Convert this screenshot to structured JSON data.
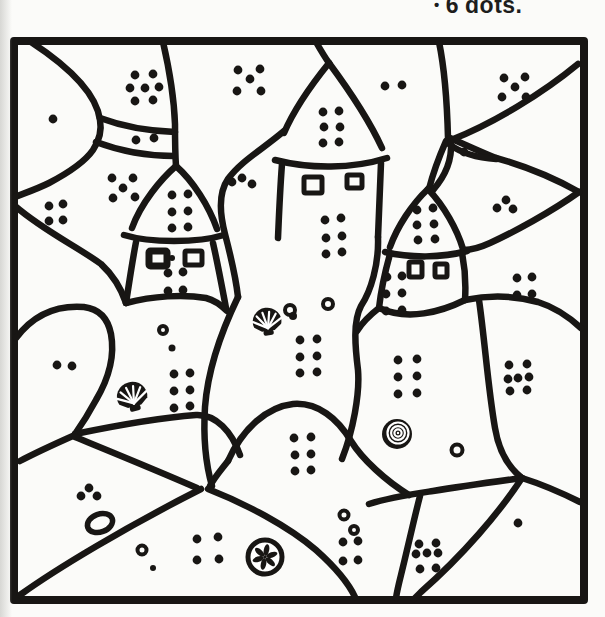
{
  "caption": {
    "bullet": "•",
    "count": "6",
    "label": "dots."
  },
  "colors": {
    "ink": "#181614",
    "paper": "#ffffff",
    "page_bg": "#fbfbf9"
  },
  "drawing": {
    "dot_radius": 4.4,
    "clusters": [
      {
        "id": "top-left-arch",
        "count": 7,
        "dots": [
          [
            135,
            75
          ],
          [
            153,
            74
          ],
          [
            130,
            88
          ],
          [
            145,
            88
          ],
          [
            159,
            87
          ],
          [
            135,
            101
          ],
          [
            153,
            100
          ]
        ]
      },
      {
        "id": "top-middle",
        "count": 5,
        "dots": [
          [
            238,
            70
          ],
          [
            260,
            69
          ],
          [
            250,
            79
          ],
          [
            237,
            91
          ],
          [
            261,
            91
          ]
        ]
      },
      {
        "id": "right-of-center-roof",
        "count": 2,
        "dots": [
          [
            385,
            86
          ],
          [
            402,
            85
          ]
        ]
      },
      {
        "id": "top-right",
        "count": 5,
        "dots": [
          [
            504,
            78
          ],
          [
            525,
            77
          ],
          [
            515,
            87
          ],
          [
            502,
            97
          ],
          [
            526,
            97
          ]
        ]
      },
      {
        "id": "corner-blob",
        "count": 1,
        "dots": [
          [
            53,
            119
          ]
        ]
      },
      {
        "id": "band-path",
        "count": 2,
        "dots": [
          [
            136,
            140
          ],
          [
            154,
            138
          ]
        ]
      },
      {
        "id": "center-roof",
        "count": 6,
        "dots": [
          [
            323,
            112
          ],
          [
            339,
            111
          ],
          [
            324,
            127
          ],
          [
            340,
            127
          ],
          [
            323,
            143
          ],
          [
            339,
            142
          ]
        ]
      },
      {
        "id": "wedge-dot",
        "count": 1,
        "dots": [
          [
            464,
            152
          ]
        ]
      },
      {
        "id": "left-of-left-tower",
        "count": 5,
        "dots": [
          [
            112,
            178
          ],
          [
            133,
            178
          ],
          [
            123,
            188
          ],
          [
            113,
            198
          ],
          [
            135,
            197
          ]
        ]
      },
      {
        "id": "left-band",
        "count": 3,
        "dots": [
          [
            232,
            182
          ],
          [
            242,
            178
          ],
          [
            252,
            184
          ]
        ]
      },
      {
        "id": "left-roof",
        "count": 6,
        "dots": [
          [
            172,
            195
          ],
          [
            188,
            194
          ],
          [
            172,
            212
          ],
          [
            188,
            211
          ],
          [
            172,
            228
          ],
          [
            188,
            227
          ]
        ]
      },
      {
        "id": "right-wedge",
        "count": 3,
        "dots": [
          [
            497,
            208
          ],
          [
            506,
            200
          ],
          [
            513,
            209
          ]
        ]
      },
      {
        "id": "left-border-region",
        "count": 4,
        "dots": [
          [
            49,
            206
          ],
          [
            63,
            204
          ],
          [
            49,
            221
          ],
          [
            63,
            220
          ]
        ]
      },
      {
        "id": "right-roof",
        "count": 6,
        "dots": [
          [
            417,
            210
          ],
          [
            433,
            208
          ],
          [
            417,
            225
          ],
          [
            434,
            224
          ],
          [
            418,
            240
          ],
          [
            435,
            239
          ]
        ]
      },
      {
        "id": "center-body",
        "count": 6,
        "dots": [
          [
            325,
            220
          ],
          [
            341,
            218
          ],
          [
            326,
            238
          ],
          [
            342,
            236
          ],
          [
            326,
            254
          ],
          [
            342,
            252
          ]
        ]
      },
      {
        "id": "left-body",
        "count": 4,
        "dots": [
          [
            168,
            273
          ],
          [
            183,
            272
          ],
          [
            168,
            291
          ],
          [
            183,
            290
          ]
        ]
      },
      {
        "id": "right-body",
        "count": 6,
        "dots": [
          [
            387,
            277
          ],
          [
            402,
            276
          ],
          [
            386,
            294
          ],
          [
            402,
            293
          ],
          [
            386,
            311
          ],
          [
            402,
            310
          ]
        ]
      },
      {
        "id": "right-upper-band",
        "count": 4,
        "dots": [
          [
            517,
            278
          ],
          [
            532,
            277
          ],
          [
            517,
            295
          ],
          [
            532,
            294
          ]
        ]
      },
      {
        "id": "left-mound",
        "count": 2,
        "dots": [
          [
            57,
            365
          ],
          [
            72,
            366
          ]
        ]
      },
      {
        "id": "left-middle",
        "count": 6,
        "dots": [
          [
            174,
            374
          ],
          [
            190,
            373
          ],
          [
            174,
            391
          ],
          [
            190,
            390
          ],
          [
            174,
            408
          ],
          [
            190,
            406
          ]
        ]
      },
      {
        "id": "center-mound",
        "count": 6,
        "dots": [
          [
            300,
            340
          ],
          [
            317,
            339
          ],
          [
            300,
            357
          ],
          [
            317,
            356
          ],
          [
            300,
            373
          ],
          [
            317,
            372
          ]
        ]
      },
      {
        "id": "right-tower-mound",
        "count": 6,
        "dots": [
          [
            398,
            360
          ],
          [
            417,
            359
          ],
          [
            398,
            377
          ],
          [
            417,
            376
          ],
          [
            398,
            394
          ],
          [
            417,
            393
          ]
        ]
      },
      {
        "id": "right-middle",
        "count": 7,
        "dots": [
          [
            509,
            365
          ],
          [
            527,
            364
          ],
          [
            508,
            379
          ],
          [
            518,
            378
          ],
          [
            529,
            377
          ],
          [
            510,
            391
          ],
          [
            527,
            390
          ]
        ]
      },
      {
        "id": "inner-dome",
        "count": 6,
        "dots": [
          [
            294,
            438
          ],
          [
            311,
            437
          ],
          [
            295,
            455
          ],
          [
            311,
            454
          ],
          [
            295,
            471
          ],
          [
            311,
            470
          ]
        ]
      },
      {
        "id": "bottom-left-wedge",
        "count": 3,
        "dots": [
          [
            81,
            496
          ],
          [
            89,
            488
          ],
          [
            97,
            496
          ]
        ]
      },
      {
        "id": "bottom-strip",
        "count": 4,
        "dots": [
          [
            197,
            539
          ],
          [
            218,
            537
          ],
          [
            197,
            560
          ],
          [
            219,
            559
          ]
        ]
      },
      {
        "id": "bottom-center",
        "count": 4,
        "dots": [
          [
            343,
            542
          ],
          [
            358,
            541
          ],
          [
            343,
            561
          ],
          [
            358,
            560
          ]
        ]
      },
      {
        "id": "bottom-right-sliver",
        "count": 7,
        "dots": [
          [
            419,
            544
          ],
          [
            436,
            543
          ],
          [
            416,
            554
          ],
          [
            427,
            553
          ],
          [
            438,
            553
          ],
          [
            420,
            569
          ],
          [
            436,
            568
          ]
        ]
      },
      {
        "id": "bottom-right-corner",
        "count": 1,
        "dots": [
          [
            518,
            523
          ]
        ]
      }
    ],
    "windows": [
      {
        "tower": "left",
        "x": 149,
        "y": 251,
        "w": 18,
        "h": 15,
        "thick": true
      },
      {
        "tower": "left",
        "x": 185,
        "y": 251,
        "w": 17,
        "h": 14
      },
      {
        "tower": "center",
        "x": 304,
        "y": 177,
        "w": 18,
        "h": 16
      },
      {
        "tower": "center",
        "x": 347,
        "y": 175,
        "w": 15,
        "h": 13
      },
      {
        "tower": "right",
        "x": 409,
        "y": 262,
        "w": 13,
        "h": 15
      },
      {
        "tower": "right",
        "x": 435,
        "y": 264,
        "w": 12,
        "h": 13
      }
    ],
    "shells": [
      {
        "type": "scallop",
        "x": 132,
        "y": 396,
        "size": 17,
        "rot": -15
      },
      {
        "type": "scallop",
        "x": 267,
        "y": 321,
        "size": 16,
        "rot": -8
      },
      {
        "type": "snail",
        "x": 397,
        "y": 434,
        "size": 15,
        "rot": 0
      },
      {
        "type": "sand-dollar",
        "x": 265,
        "y": 557,
        "size": 17,
        "rot": 0
      }
    ],
    "pebbles": [
      {
        "x": 172,
        "y": 258,
        "r": 3,
        "style": "filled"
      },
      {
        "x": 163,
        "y": 330,
        "r": 4,
        "style": "outline"
      },
      {
        "x": 172,
        "y": 348,
        "r": 3.5,
        "style": "filled"
      },
      {
        "x": 290,
        "y": 310,
        "r": 5,
        "style": "outline"
      },
      {
        "x": 328,
        "y": 304,
        "r": 5,
        "style": "outline"
      },
      {
        "x": 293,
        "y": 316,
        "r": 4,
        "style": "filled"
      },
      {
        "x": 457,
        "y": 450,
        "r": 5.5,
        "style": "outline"
      },
      {
        "x": 100,
        "y": 523,
        "rx": 13,
        "ry": 9,
        "rot": -20,
        "style": "outline"
      },
      {
        "x": 142,
        "y": 550,
        "r": 4.5,
        "style": "outline"
      },
      {
        "x": 153,
        "y": 568,
        "r": 3,
        "style": "filled"
      },
      {
        "x": 344,
        "y": 515,
        "r": 4.5,
        "style": "outline"
      },
      {
        "x": 354,
        "y": 530,
        "r": 4,
        "style": "outline"
      }
    ]
  }
}
